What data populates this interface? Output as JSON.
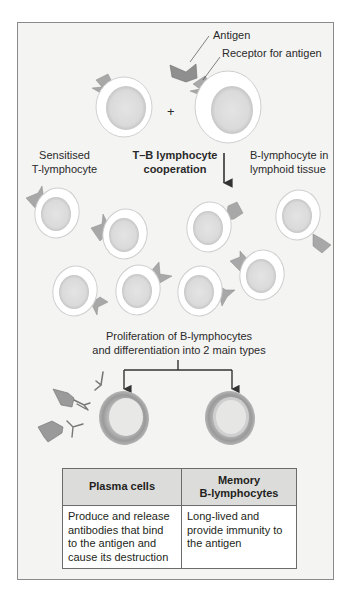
{
  "labels": {
    "antigen": "Antigen",
    "receptor": "Receptor for antigen",
    "plus": "+",
    "sensitised_line1": "Sensitised",
    "sensitised_line2": "T-lymphocyte",
    "cooperation_line1": "T–B lymphocyte",
    "cooperation_line2": "cooperation",
    "blymph_line1": "B-lymphocyte in",
    "blymph_line2": "lymphoid tissue",
    "proliferation_line1": "Proliferation of B-lymphocytes",
    "proliferation_line2": "and differentiation into 2 main types"
  },
  "table": {
    "headers": [
      "Plasma cells",
      "Memory B-lymphocytes"
    ],
    "header_lines": [
      [
        "Plasma cells"
      ],
      [
        "Memory",
        "B-lymphocytes"
      ]
    ],
    "rows": [
      [
        [
          "Produce and release",
          "antibodies that bind",
          "to the antigen and",
          "cause its destruction"
        ],
        [
          "Long-lived and",
          "provide immunity to",
          "the antigen"
        ]
      ]
    ]
  },
  "colors": {
    "background": "#f4f4f3",
    "cell_membrane": "#ffffff",
    "cell_nucleus": "#dadada",
    "receptor": "#a8a8a8",
    "antigen": "#8f8f8f",
    "differentiated_ring": "#9a9a9a"
  }
}
